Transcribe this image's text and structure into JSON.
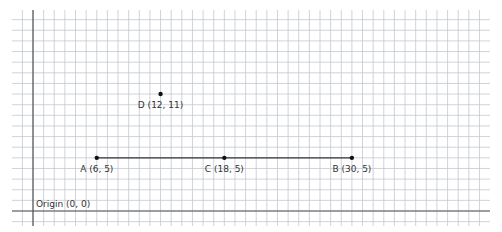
{
  "diagram": {
    "type": "coordinate-grid",
    "grid": {
      "unit_px": 10.63,
      "origin_px": [
        33,
        211
      ],
      "x_range": [
        -2,
        43
      ],
      "y_range": [
        -1,
        19
      ],
      "line_color": "#c4c8d0",
      "axis_color": "#555555"
    },
    "origin": {
      "label": "Origin (0, 0)",
      "x": 0,
      "y": 0
    },
    "points": [
      {
        "id": "A",
        "label": "A (6, 5)",
        "x": 6,
        "y": 5
      },
      {
        "id": "C",
        "label": "C (18, 5)",
        "x": 18,
        "y": 5
      },
      {
        "id": "B",
        "label": "B (30, 5)",
        "x": 30,
        "y": 5
      },
      {
        "id": "D",
        "label": "D (12, 11)",
        "x": 12,
        "y": 11
      }
    ],
    "segments": [
      {
        "from": "A",
        "to": "B"
      }
    ]
  }
}
